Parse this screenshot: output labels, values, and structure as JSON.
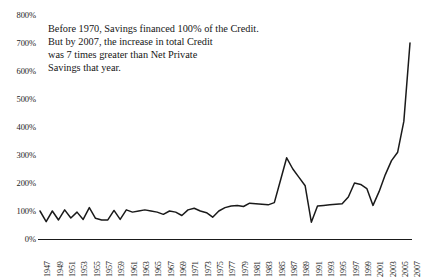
{
  "annotation": {
    "line1": "Before 1970, Savings financed 100% of the Credit.",
    "line2": "But by 2007, the increase in total Credit",
    "line3": "was 7 times greater than Net Private",
    "line4": "Savings that year."
  },
  "chart_data": {
    "type": "line",
    "title": "",
    "xlabel": "",
    "ylabel": "",
    "ylim": [
      0,
      800
    ],
    "xlim": [
      1947,
      2007
    ],
    "grid": false,
    "legend": false,
    "line_color": "#1a1a1a",
    "ytick_labels": [
      "800%",
      "700%",
      "600%",
      "500%",
      "400%",
      "300%",
      "200%",
      "100%",
      "0%"
    ],
    "ytick_values": [
      800,
      700,
      600,
      500,
      400,
      300,
      200,
      100,
      0
    ],
    "xtick_labels": [
      "1947",
      "1949",
      "1951",
      "1953",
      "1955",
      "1957",
      "1959",
      "1961",
      "1963",
      "1965",
      "1967",
      "1969",
      "1971",
      "1973",
      "1975",
      "1977",
      "1979",
      "1981",
      "1983",
      "1985",
      "1987",
      "1989",
      "1991",
      "1993",
      "1995",
      "1997",
      "1999",
      "2001",
      "2003",
      "2005",
      "2007"
    ],
    "x": [
      1947,
      1948,
      1949,
      1950,
      1951,
      1952,
      1953,
      1954,
      1955,
      1956,
      1957,
      1958,
      1959,
      1960,
      1961,
      1962,
      1963,
      1964,
      1965,
      1966,
      1967,
      1968,
      1969,
      1970,
      1971,
      1972,
      1973,
      1974,
      1975,
      1976,
      1977,
      1978,
      1979,
      1980,
      1981,
      1982,
      1983,
      1984,
      1985,
      1986,
      1987,
      1988,
      1989,
      1990,
      1991,
      1992,
      1993,
      1994,
      1995,
      1996,
      1997,
      1998,
      1999,
      2000,
      2001,
      2002,
      2003,
      2004,
      2005,
      2006,
      2007
    ],
    "values": [
      100,
      62,
      100,
      68,
      104,
      75,
      96,
      70,
      112,
      74,
      68,
      68,
      102,
      70,
      104,
      96,
      100,
      104,
      100,
      96,
      88,
      100,
      96,
      84,
      104,
      110,
      100,
      94,
      78,
      100,
      112,
      118,
      120,
      116,
      128,
      126,
      124,
      122,
      130,
      210,
      290,
      250,
      220,
      190,
      60,
      118,
      120,
      122,
      124,
      126,
      150,
      200,
      195,
      180,
      120,
      170,
      230,
      280,
      310,
      420,
      700
    ],
    "series_name": "Credit growth as share of Net Private Savings"
  }
}
